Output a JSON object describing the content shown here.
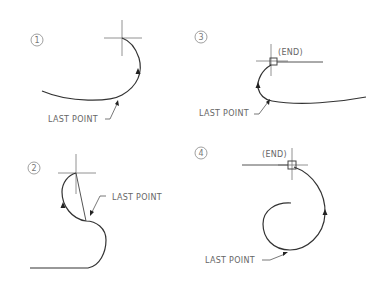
{
  "diagram": {
    "type": "CAD arc continuation illustration",
    "panels": [
      {
        "number": "1",
        "labels": {
          "last_point": "LAST POINT"
        },
        "snap_label": null
      },
      {
        "number": "2",
        "labels": {
          "last_point": "LAST POINT"
        },
        "snap_label": null
      },
      {
        "number": "3",
        "labels": {
          "last_point": "LAST POINT"
        },
        "snap_label": "(END)"
      },
      {
        "number": "4",
        "labels": {
          "last_point": "LAST POINT"
        },
        "snap_label": "(END)"
      }
    ],
    "colors": {
      "background": "#ffffff",
      "line": "#333333",
      "text": "#666666"
    }
  }
}
